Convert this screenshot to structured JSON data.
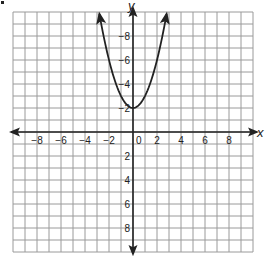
{
  "chart_data": {
    "type": "line",
    "title": "",
    "xlabel": "x",
    "ylabel": "y",
    "xlim": [
      -10,
      10
    ],
    "ylim": [
      -10,
      10
    ],
    "grid": true,
    "grid_step": 1,
    "x_ticks": [
      -8,
      -6,
      -4,
      -2,
      0,
      2,
      4,
      6,
      8
    ],
    "y_ticks": [
      -8,
      -6,
      -4,
      -2,
      2,
      4,
      6,
      8
    ],
    "x_tick_labels": [
      "−8",
      "−6",
      "−4",
      "−2",
      "0",
      "2",
      "4",
      "6",
      "8"
    ],
    "y_tick_labels": [
      "8",
      "6",
      "4",
      "2",
      "−2",
      "−4",
      "−6",
      "−8"
    ],
    "series": [
      {
        "name": "parabola",
        "equation": "y = x^2 + 2",
        "vertex": [
          0,
          2
        ],
        "arrows_at_ends": true,
        "x": [
          -2.8,
          -2.5,
          -2,
          -1.5,
          -1,
          -0.5,
          0,
          0.5,
          1,
          1.5,
          2,
          2.5,
          2.8
        ],
        "values": [
          9.84,
          8.25,
          6,
          4.25,
          3,
          2.25,
          2,
          2.25,
          3,
          4.25,
          6,
          8.25,
          9.84
        ]
      }
    ],
    "legend": null,
    "axes_have_arrows": true
  },
  "labels": {
    "x_axis": "x",
    "y_axis": "y",
    "origin": "0"
  },
  "colors": {
    "grid": "#9a9a9a",
    "axis": "#222222",
    "curve": "#222222",
    "background": "#ffffff"
  }
}
